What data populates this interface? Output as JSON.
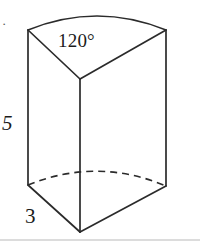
{
  "figure": {
    "kind": "3d-geometry-diagram",
    "stroke_color": "#2b2b2b",
    "background_color": "#ffffff",
    "labels": {
      "angle": "120°",
      "height": "5",
      "radius": "3",
      "item_marker": "·"
    },
    "label_names": {
      "angle": "central-angle-label",
      "height": "height-label",
      "radius": "radius-label"
    },
    "footer_rule": true
  },
  "geometry": {
    "top_apex": {
      "x": 80,
      "y": 79
    },
    "top_left_corner": {
      "x": 28,
      "y": 30
    },
    "top_right_corner": {
      "x": 166,
      "y": 30
    },
    "top_arc_peak": {
      "x": 97,
      "y": 13
    },
    "bottom_apex": {
      "x": 80,
      "y": 232
    },
    "bottom_left_corner": {
      "x": 28,
      "y": 185
    },
    "bottom_right_corner": {
      "x": 166,
      "y": 186
    },
    "bottom_arc_peak": {
      "x": 97,
      "y": 168
    },
    "footer_rule_y": 240
  }
}
